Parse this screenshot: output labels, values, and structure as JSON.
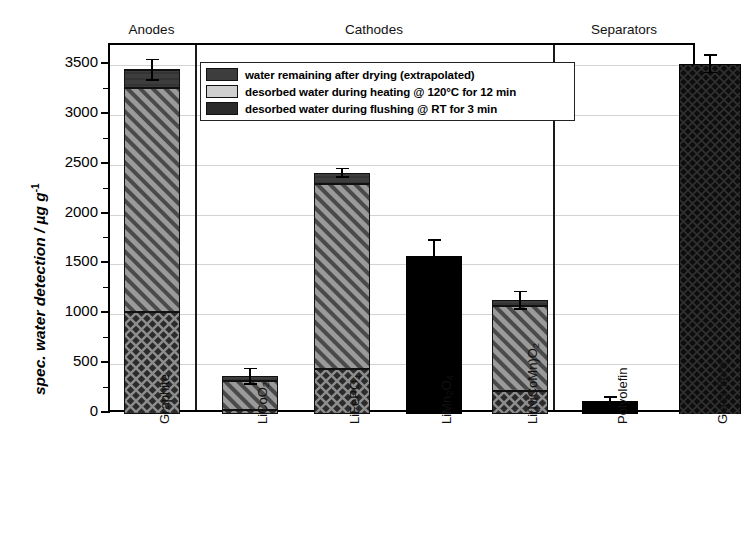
{
  "chart_data": {
    "type": "bar",
    "title": "",
    "xlabel": "",
    "ylabel": "spec. water detection / µg g⁻¹",
    "ylim": [
      0,
      3700
    ],
    "ytick_step": 500,
    "yticks": [
      0,
      500,
      1000,
      1500,
      2000,
      2500,
      3000,
      3500
    ],
    "grid": "horizontal major gridlines, light gray",
    "legend_position": "inside top-left of plot area",
    "stacked": true,
    "groups": [
      {
        "name": "Anodes",
        "categories": [
          "Graphite"
        ]
      },
      {
        "name": "Cathodes",
        "categories": [
          "LiCoO2",
          "LiFePO4",
          "LiMn2O4",
          "Li(NiCoMn)O2"
        ]
      },
      {
        "name": "Separators",
        "categories": [
          "Polyolefin",
          "Glass fibre"
        ]
      }
    ],
    "categories": [
      "Graphite",
      "LiCoO2",
      "LiFePO4",
      "LiMn2O4",
      "Li(NiCoMn)O2",
      "Polyolefin",
      "Glass fibre"
    ],
    "series": [
      {
        "name": "desorbed water during flushing @ RT for 3 min",
        "pattern": "crosshatch",
        "color": "#2e2e2e",
        "values": [
          1020,
          40,
          450,
          null,
          230,
          null,
          null
        ]
      },
      {
        "name": "desorbed water during heating @ 120°C for 12 min",
        "pattern": "diagonal-hatch",
        "color": "#8a8a8a",
        "values": [
          2250,
          290,
          1860,
          null,
          850,
          null,
          null
        ]
      },
      {
        "name": "water remaining after drying (extrapolated)",
        "pattern": "solid-dark",
        "color": "#3a3a3a",
        "values": [
          185,
          50,
          110,
          null,
          60,
          null,
          null
        ]
      }
    ],
    "totals": [
      3450,
      380,
      2420,
      1580,
      1140,
      135,
      3510
    ],
    "errors": [
      110,
      85,
      50,
      170,
      95,
      45,
      95
    ],
    "unsegmented_bars": [
      {
        "category": "LiMn2O4",
        "value": 1580,
        "fill": "solid-black"
      },
      {
        "category": "Polyolefin",
        "value": 135,
        "fill": "solid-black"
      },
      {
        "category": "Glass fibre",
        "value": 3510,
        "fill": "dark-crosshatch"
      }
    ]
  },
  "axis": {
    "y_title_main": "spec. water detection / ",
    "y_title_unit_mu": "µg g",
    "y_title_exp": "-1",
    "tick_labels": [
      "3500",
      "3000",
      "2500",
      "2000",
      "1500",
      "1000",
      "500",
      "0"
    ]
  },
  "group_headers": [
    {
      "label": "Anodes"
    },
    {
      "label": "Cathodes"
    },
    {
      "label": "Separators"
    }
  ],
  "legend": {
    "items": [
      {
        "label": "water remaining after drying (extrapolated)",
        "swatch": "solid-dark-swatch"
      },
      {
        "label": "desorbed water during heating @ 120°C for 12 min",
        "swatch": "diagonal-hatch-swatch"
      },
      {
        "label": "desorbed water during flushing @ RT for 3 min",
        "swatch": "crosshatch-swatch"
      }
    ]
  },
  "x_labels": [
    {
      "html": "Graphite"
    },
    {
      "html": "LiCoO<sub>2</sub>"
    },
    {
      "html": "LiFePO<sub>4</sub>"
    },
    {
      "html": "LiMn<sub>2</sub>O<sub>4</sub>"
    },
    {
      "html": "Li(NiCoMn)O<sub>2</sub>"
    },
    {
      "html": "Polyolefin"
    },
    {
      "html": "Glass fibre"
    }
  ],
  "colors": {
    "dark_cap": "#3a3a3a",
    "hatch_mid": "#8a8a8a",
    "cross_base": "#2e2e2e",
    "solid_black": "#000000",
    "gridline": "#d3d3d3",
    "frame": "#000000"
  }
}
